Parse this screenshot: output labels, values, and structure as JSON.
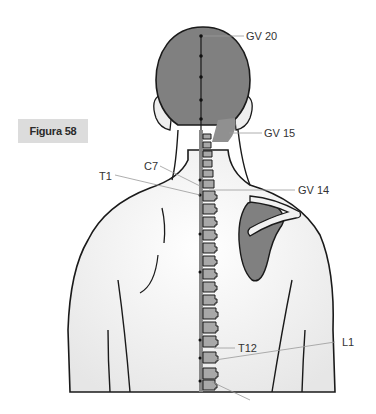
{
  "figure": {
    "label": "Figura 58"
  },
  "points": [
    {
      "id": "gv20",
      "label": "GV 20"
    },
    {
      "id": "gv15",
      "label": "GV 15"
    },
    {
      "id": "gv14",
      "label": "GV 14"
    },
    {
      "id": "c7",
      "label": "C7"
    },
    {
      "id": "t1",
      "label": "T1"
    },
    {
      "id": "t12",
      "label": "T12"
    },
    {
      "id": "l1",
      "label": "L1"
    }
  ],
  "colors": {
    "skin": "#f2f2f2",
    "outline": "#1a1a1a",
    "highlight_gray": "#808080",
    "vertebra": "#a8a8a8",
    "leader_line": "#999999",
    "label_bg": "#dcdcdc"
  }
}
